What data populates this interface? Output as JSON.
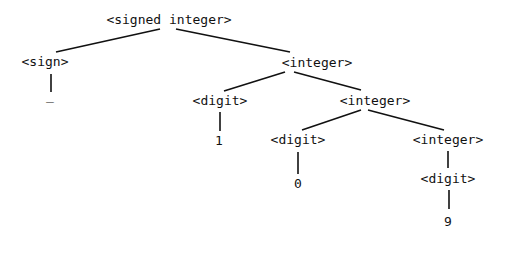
{
  "diagram": {
    "type": "parse-tree",
    "line_color": "#111111",
    "nodes": [
      {
        "id": "n0",
        "label": "<signed integer>",
        "x": 169,
        "y": 12
      },
      {
        "id": "n1",
        "label": "<sign>",
        "x": 45,
        "y": 54
      },
      {
        "id": "n2",
        "label": "_",
        "x": 50,
        "y": 88
      },
      {
        "id": "n3",
        "label": "<integer>",
        "x": 317,
        "y": 55
      },
      {
        "id": "n4",
        "label": "<digit>",
        "x": 220,
        "y": 93
      },
      {
        "id": "n5",
        "label": "1",
        "x": 219,
        "y": 133
      },
      {
        "id": "n6",
        "label": "<integer>",
        "x": 375,
        "y": 93
      },
      {
        "id": "n7",
        "label": "<digit>",
        "x": 298,
        "y": 132
      },
      {
        "id": "n8",
        "label": "0",
        "x": 298,
        "y": 176
      },
      {
        "id": "n9",
        "label": "<integer>",
        "x": 448,
        "y": 132
      },
      {
        "id": "n10",
        "label": "<digit>",
        "x": 448,
        "y": 171
      },
      {
        "id": "n11",
        "label": "9",
        "x": 448,
        "y": 214
      }
    ],
    "edges": [
      {
        "from": "n0",
        "to": "n1",
        "x1": 160,
        "y1": 29,
        "x2": 56,
        "y2": 52
      },
      {
        "from": "n0",
        "to": "n3",
        "x1": 176,
        "y1": 29,
        "x2": 290,
        "y2": 52
      },
      {
        "from": "n1",
        "to": "n2",
        "x1": 51,
        "y1": 74,
        "x2": 51,
        "y2": 92
      },
      {
        "from": "n3",
        "to": "n4",
        "x1": 285,
        "y1": 72,
        "x2": 224,
        "y2": 91
      },
      {
        "from": "n3",
        "to": "n6",
        "x1": 294,
        "y1": 72,
        "x2": 361,
        "y2": 90
      },
      {
        "from": "n4",
        "to": "n5",
        "x1": 220,
        "y1": 112,
        "x2": 220,
        "y2": 131
      },
      {
        "from": "n6",
        "to": "n7",
        "x1": 361,
        "y1": 110,
        "x2": 302,
        "y2": 130
      },
      {
        "from": "n6",
        "to": "n9",
        "x1": 368,
        "y1": 110,
        "x2": 444,
        "y2": 130
      },
      {
        "from": "n7",
        "to": "n8",
        "x1": 298,
        "y1": 152,
        "x2": 298,
        "y2": 174
      },
      {
        "from": "n9",
        "to": "n10",
        "x1": 448,
        "y1": 151,
        "x2": 448,
        "y2": 168
      },
      {
        "from": "n10",
        "to": "n11",
        "x1": 449,
        "y1": 190,
        "x2": 449,
        "y2": 209
      }
    ]
  }
}
